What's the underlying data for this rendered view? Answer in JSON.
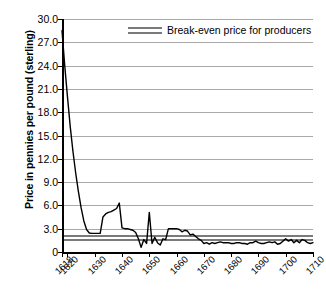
{
  "chart_data": {
    "type": "line",
    "title": "",
    "subtitle": "",
    "xlabel": "",
    "ylabel": "Price in pennies per pound (sterling)",
    "xlim": [
      1618,
      1710
    ],
    "ylim": [
      0,
      30
    ],
    "ytick_labels": [
      "30.0",
      "27.0",
      "24.0",
      "21.0",
      "18.0",
      "15.0",
      "12.0",
      "9.0",
      "6.0",
      "3.0",
      "0"
    ],
    "ytick_values": [
      30,
      27,
      24,
      21,
      18,
      15,
      12,
      9,
      6,
      3,
      0
    ],
    "xtick_labels": [
      "1618",
      "1620",
      "1630",
      "1640",
      "1650",
      "1660",
      "1670",
      "1680",
      "1690",
      "1700",
      "1710"
    ],
    "xtick_values": [
      1618,
      1620,
      1630,
      1640,
      1650,
      1660,
      1670,
      1680,
      1690,
      1700,
      1710
    ],
    "grid": "horizontal",
    "legend_position": "top-center",
    "legend": [
      {
        "name": "Break-even price for producers",
        "color": "#7a7a7a",
        "style": "double-line"
      }
    ],
    "annotations": [],
    "series": [
      {
        "name": "Price in pennies per pound (sterling)",
        "color": "#000000",
        "x": [
          1618,
          1619,
          1620,
          1621,
          1622,
          1623,
          1624,
          1625,
          1626,
          1627,
          1628,
          1629,
          1630,
          1631,
          1632,
          1633,
          1634,
          1635,
          1636,
          1637,
          1638,
          1639,
          1640,
          1641,
          1642,
          1643,
          1644,
          1645,
          1646,
          1647,
          1648,
          1649,
          1650,
          1651,
          1652,
          1653,
          1654,
          1655,
          1656,
          1657,
          1658,
          1659,
          1660,
          1661,
          1662,
          1663,
          1664,
          1665,
          1666,
          1667,
          1668,
          1669,
          1670,
          1671,
          1672,
          1673,
          1674,
          1675,
          1676,
          1677,
          1678,
          1679,
          1680,
          1681,
          1682,
          1683,
          1684,
          1685,
          1686,
          1687,
          1688,
          1689,
          1690,
          1691,
          1692,
          1693,
          1694,
          1695,
          1696,
          1697,
          1698,
          1699,
          1700,
          1701,
          1702,
          1703,
          1704,
          1705,
          1706,
          1707,
          1708,
          1709,
          1710
        ],
        "y": [
          28.5,
          24.0,
          20.0,
          16.2,
          13.0,
          10.2,
          7.8,
          5.7,
          4.0,
          2.9,
          2.45,
          2.4,
          2.4,
          2.4,
          2.4,
          4.5,
          4.9,
          5.1,
          5.2,
          5.4,
          5.6,
          6.3,
          3.1,
          3.0,
          3.0,
          2.9,
          2.8,
          2.5,
          1.7,
          0.6,
          1.6,
          1.1,
          5.1,
          1.1,
          1.9,
          1.2,
          0.9,
          1.7,
          1.6,
          3.0,
          3.0,
          3.0,
          3.0,
          2.9,
          2.6,
          2.8,
          2.7,
          2.2,
          2.3,
          2.0,
          1.7,
          1.5,
          1.1,
          1.2,
          1.0,
          1.2,
          1.1,
          1.2,
          1.3,
          1.2,
          1.2,
          1.2,
          1.1,
          1.1,
          1.2,
          1.2,
          1.1,
          1.1,
          1.0,
          1.2,
          1.2,
          1.4,
          1.2,
          1.1,
          1.1,
          1.2,
          1.3,
          1.2,
          1.3,
          1.0,
          1.1,
          1.4,
          1.7,
          1.4,
          1.6,
          1.2,
          1.5,
          1.2,
          1.6,
          1.5,
          1.2,
          1.1,
          1.2
        ]
      },
      {
        "name": "Break-even upper",
        "color": "#7a7a7a",
        "style": "horizontal-line",
        "value": 2.0
      },
      {
        "name": "Break-even lower",
        "color": "#7a7a7a",
        "style": "horizontal-line",
        "value": 1.55
      }
    ]
  },
  "legend": {
    "break_even_label": "Break-even price for producers"
  },
  "axis": {
    "y_title": "Price in pennies per pound (sterling)"
  }
}
